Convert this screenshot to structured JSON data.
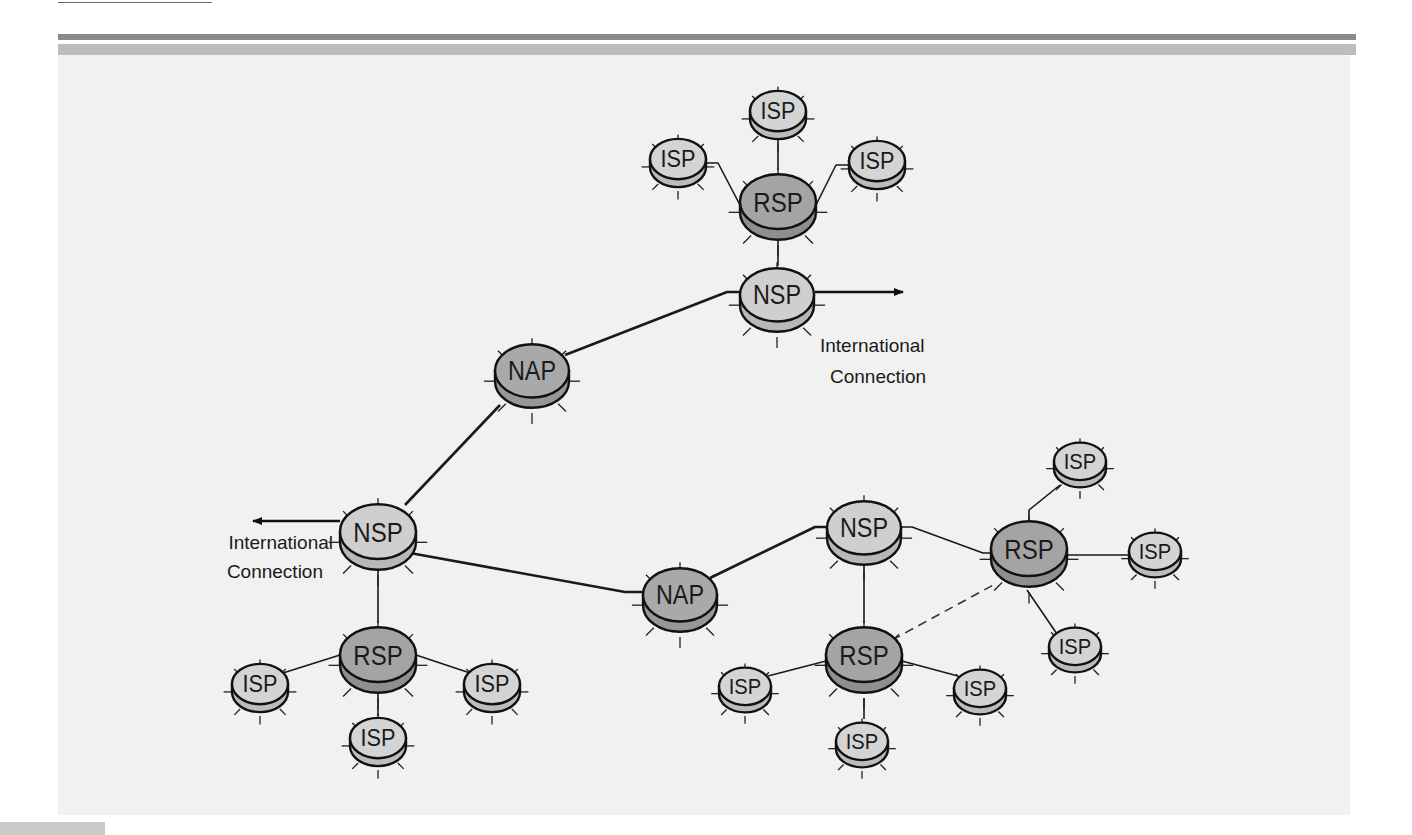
{
  "figure": {
    "title": "",
    "colors": {
      "panel": "#f1f1f1",
      "isp_top": "#d4d4d4",
      "isp_side": "#bcbcbc",
      "nsp_top": "#cfcfcf",
      "nsp_side": "#b8b8b8",
      "nap_top": "#a9a9a9",
      "nap_side": "#979797",
      "rsp_top": "#a4a4a4",
      "rsp_side": "#8f8f8f",
      "outline": "#111111"
    }
  },
  "nodes": [
    {
      "id": "isp-top",
      "type": "ISP",
      "label": "ISP",
      "x": 778,
      "y": 115,
      "r": 28
    },
    {
      "id": "isp-top-left",
      "type": "ISP",
      "label": "ISP",
      "x": 678,
      "y": 163,
      "r": 28
    },
    {
      "id": "isp-top-right",
      "type": "ISP",
      "label": "ISP",
      "x": 877,
      "y": 165,
      "r": 28
    },
    {
      "id": "rsp-top",
      "type": "RSP",
      "label": "RSP",
      "x": 778,
      "y": 207,
      "r": 38
    },
    {
      "id": "nsp-top",
      "type": "NSP",
      "label": "NSP",
      "x": 777,
      "y": 300,
      "r": 37
    },
    {
      "id": "nap-top",
      "type": "NAP",
      "label": "NAP",
      "x": 532,
      "y": 376,
      "r": 37
    },
    {
      "id": "nsp-left",
      "type": "NSP",
      "label": "NSP",
      "x": 378,
      "y": 537,
      "r": 38
    },
    {
      "id": "rsp-left",
      "type": "RSP",
      "label": "RSP",
      "x": 378,
      "y": 660,
      "r": 38
    },
    {
      "id": "isp-bl-left",
      "type": "ISP",
      "label": "ISP",
      "x": 260,
      "y": 688,
      "r": 28
    },
    {
      "id": "isp-bl-right",
      "type": "ISP",
      "label": "ISP",
      "x": 492,
      "y": 688,
      "r": 28
    },
    {
      "id": "isp-bl-bottom",
      "type": "ISP",
      "label": "ISP",
      "x": 378,
      "y": 742,
      "r": 28
    },
    {
      "id": "nap-bottom",
      "type": "NAP",
      "label": "NAP",
      "x": 680,
      "y": 600,
      "r": 37
    },
    {
      "id": "nsp-right",
      "type": "NSP",
      "label": "NSP",
      "x": 864,
      "y": 533,
      "r": 37
    },
    {
      "id": "rsp-right",
      "type": "RSP",
      "label": "RSP",
      "x": 1029,
      "y": 554,
      "r": 38
    },
    {
      "id": "isp-r-top",
      "type": "ISP",
      "label": "ISP",
      "x": 1080,
      "y": 465,
      "r": 26
    },
    {
      "id": "isp-r-right",
      "type": "ISP",
      "label": "ISP",
      "x": 1155,
      "y": 555,
      "r": 26
    },
    {
      "id": "isp-r-bottom",
      "type": "ISP",
      "label": "ISP",
      "x": 1075,
      "y": 650,
      "r": 26
    },
    {
      "id": "rsp-bottom",
      "type": "RSP",
      "label": "RSP",
      "x": 864,
      "y": 660,
      "r": 38
    },
    {
      "id": "isp-br-left",
      "type": "ISP",
      "label": "ISP",
      "x": 745,
      "y": 690,
      "r": 26
    },
    {
      "id": "isp-br-right",
      "type": "ISP",
      "label": "ISP",
      "x": 980,
      "y": 692,
      "r": 26
    },
    {
      "id": "isp-br-bottom",
      "type": "ISP",
      "label": "ISP",
      "x": 862,
      "y": 745,
      "r": 26
    }
  ],
  "edges": [
    {
      "from": "isp-top",
      "to": "rsp-top",
      "style": "thin",
      "points": [
        [
          778,
          140
        ],
        [
          778,
          170
        ]
      ]
    },
    {
      "from": "isp-top-left",
      "to": "rsp-top",
      "style": "thin",
      "points": [
        [
          706,
          163
        ],
        [
          718,
          163
        ],
        [
          740,
          205
        ]
      ]
    },
    {
      "from": "isp-top-right",
      "to": "rsp-top",
      "style": "thin",
      "points": [
        [
          849,
          165
        ],
        [
          836,
          165
        ],
        [
          816,
          205
        ]
      ]
    },
    {
      "from": "rsp-top",
      "to": "nsp-top",
      "style": "thin",
      "points": [
        [
          778,
          240
        ],
        [
          778,
          266
        ]
      ]
    },
    {
      "from": "nsp-top",
      "to": "nap-top",
      "style": "thick",
      "points": [
        [
          740,
          292
        ],
        [
          727,
          292
        ],
        [
          565,
          355
        ]
      ]
    },
    {
      "from": "nap-top",
      "to": "nsp-left",
      "style": "thick",
      "points": [
        [
          500,
          405
        ],
        [
          405,
          505
        ]
      ]
    },
    {
      "from": "nsp-left",
      "to": "nap-bottom",
      "style": "thick",
      "points": [
        [
          410,
          553
        ],
        [
          625,
          592
        ],
        [
          643,
          592
        ]
      ]
    },
    {
      "from": "nap-bottom",
      "to": "nsp-right",
      "style": "thick",
      "points": [
        [
          710,
          578
        ],
        [
          815,
          527
        ],
        [
          827,
          527
        ]
      ]
    },
    {
      "from": "nsp-left",
      "to": "rsp-left",
      "style": "thin",
      "points": [
        [
          378,
          570
        ],
        [
          378,
          623
        ]
      ]
    },
    {
      "from": "rsp-left",
      "to": "isp-bl-left",
      "style": "thin",
      "points": [
        [
          340,
          655
        ],
        [
          283,
          673
        ]
      ]
    },
    {
      "from": "rsp-left",
      "to": "isp-bl-right",
      "style": "thin",
      "points": [
        [
          416,
          655
        ],
        [
          470,
          673
        ]
      ]
    },
    {
      "from": "rsp-left",
      "to": "isp-bl-bottom",
      "style": "thin",
      "points": [
        [
          378,
          693
        ],
        [
          378,
          716
        ]
      ]
    },
    {
      "from": "nsp-right",
      "to": "rsp-bottom",
      "style": "thin",
      "points": [
        [
          864,
          566
        ],
        [
          864,
          623
        ]
      ]
    },
    {
      "from": "nsp-right",
      "to": "rsp-right",
      "style": "thin",
      "points": [
        [
          901,
          527
        ],
        [
          912,
          527
        ],
        [
          983,
          553
        ],
        [
          991,
          553
        ]
      ]
    },
    {
      "from": "rsp-bottom",
      "to": "rsp-right",
      "style": "dashed",
      "points": [
        [
          892,
          640
        ],
        [
          997,
          583
        ]
      ]
    },
    {
      "from": "rsp-right",
      "to": "isp-r-top",
      "style": "thin",
      "points": [
        [
          1029,
          520
        ],
        [
          1029,
          510
        ],
        [
          1060,
          485
        ]
      ]
    },
    {
      "from": "rsp-right",
      "to": "isp-r-right",
      "style": "thin",
      "points": [
        [
          1067,
          555
        ],
        [
          1129,
          555
        ]
      ]
    },
    {
      "from": "rsp-right",
      "to": "isp-r-bottom",
      "style": "thin",
      "points": [
        [
          1027,
          590
        ],
        [
          1057,
          634
        ]
      ]
    },
    {
      "from": "rsp-bottom",
      "to": "isp-br-left",
      "style": "thin",
      "points": [
        [
          826,
          661
        ],
        [
          768,
          676
        ]
      ]
    },
    {
      "from": "rsp-bottom",
      "to": "isp-br-right",
      "style": "thin",
      "points": [
        [
          902,
          661
        ],
        [
          958,
          676
        ]
      ]
    },
    {
      "from": "rsp-bottom",
      "to": "isp-br-bottom",
      "style": "thin",
      "points": [
        [
          864,
          698
        ],
        [
          864,
          719
        ]
      ]
    }
  ],
  "external_links": [
    {
      "id": "intl-right",
      "from": "nsp-top",
      "line1": "International",
      "line2": "Connection",
      "arrow": {
        "x1": 815,
        "y1": 292,
        "x2": 903,
        "y2": 292,
        "dir": "right"
      },
      "text_x": 820,
      "text_y1": 352,
      "text_y2": 383,
      "anchor": "start"
    },
    {
      "id": "intl-left",
      "from": "nsp-left",
      "line1": "International",
      "line2": "Connection",
      "arrow": {
        "x1": 340,
        "y1": 521,
        "x2": 253,
        "y2": 521,
        "dir": "left"
      },
      "text_x": 333,
      "text_y1": 549,
      "text_y2": 578,
      "anchor": "end"
    }
  ]
}
